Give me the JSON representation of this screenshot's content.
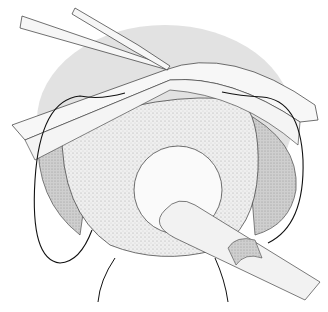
{
  "illustration": {
    "subject": "surgical illustration",
    "elements": [
      "forceps",
      "retracted tissue flaps",
      "sutures",
      "organ dome",
      "tube/catheter"
    ],
    "colors": {
      "background": "#ffffff",
      "halo": "#e2e2e2",
      "dome": "#ececec",
      "dark_rim": "#c9c9c9",
      "line": "#1a1a1a"
    }
  }
}
